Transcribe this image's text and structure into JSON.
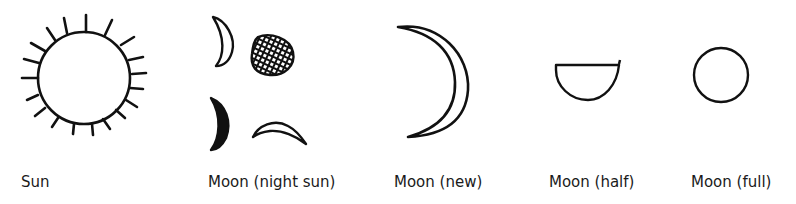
{
  "figure": {
    "stroke_color": "#111111",
    "background": "#ffffff",
    "symbols": [
      {
        "id": "sun",
        "label": "Sun",
        "icon": "sun-rayed-circle-icon"
      },
      {
        "id": "moon-night-sun",
        "label": "Moon (night sun)",
        "icon": "night-sun-composite-icon",
        "parts": [
          "crescent-outline",
          "hatched-disc",
          "filled-crescent",
          "horizontal-crescent-outline"
        ]
      },
      {
        "id": "moon-new",
        "label": "Moon (new)",
        "icon": "crescent-moon-icon"
      },
      {
        "id": "moon-half",
        "label": "Moon (half)",
        "icon": "half-moon-icon"
      },
      {
        "id": "moon-full",
        "label": "Moon (full)",
        "icon": "full-moon-circle-icon"
      }
    ]
  }
}
